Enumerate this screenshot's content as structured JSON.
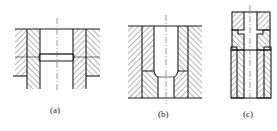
{
  "figure": {
    "type": "engineering cross-section drawing",
    "panels": [
      {
        "id": "a",
        "label": "(a)",
        "description": "through sleeve with relief groove in bore, set in stepped outer body"
      },
      {
        "id": "b",
        "label": "(b)",
        "description": "sleeve with chamfered shoulder, bore steps down to smaller diameter"
      },
      {
        "id": "c",
        "label": "(c)",
        "description": "stacked three-part assembly: top cap, stepped middle ring, lower double-walled sleeve"
      }
    ]
  },
  "colors": {
    "line": "#1a1a1a",
    "background": "#ffffff"
  }
}
